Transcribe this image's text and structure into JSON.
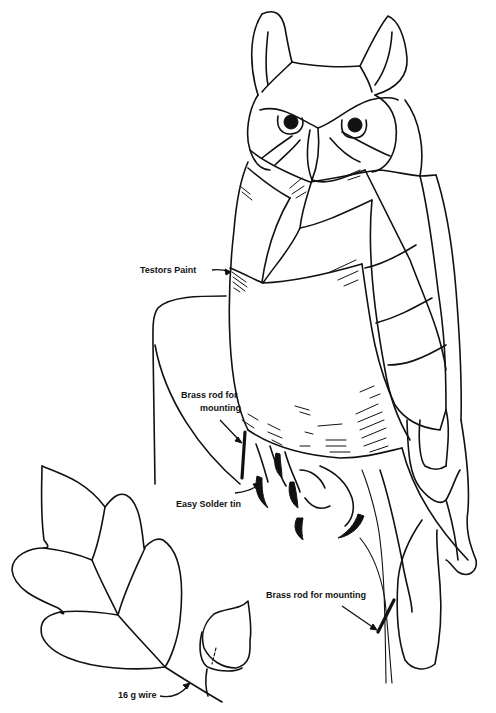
{
  "figure": {
    "colors": {
      "line": "#111111",
      "background": "#ffffff"
    }
  },
  "labels": {
    "testors_paint": "Testors Paint",
    "brass_rod_body_line1": "Brass rod for",
    "brass_rod_body_line2": "mounting",
    "easy_solder_tin": "Easy Solder tin",
    "brass_rod_tail": "Brass rod for mounting",
    "wire": "16 g wire"
  }
}
